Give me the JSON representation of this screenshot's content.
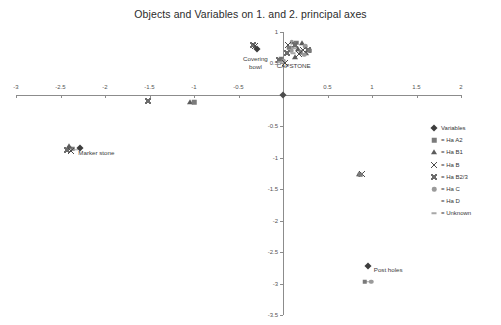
{
  "chart_data": {
    "type": "scatter",
    "title": "Objects and Variables on 1. and 2. principal axes",
    "xlabel": "",
    "ylabel": "",
    "xlim": [
      -3,
      2
    ],
    "ylim": [
      -3.5,
      1
    ],
    "grid": false,
    "legend_position": "right",
    "xticks": [
      -3,
      -2.5,
      -2,
      -1.5,
      -1,
      -0.5,
      0,
      0.5,
      1,
      1.5,
      2
    ],
    "xtick_labels": [
      "-3",
      "-2.5",
      "-2",
      "-1.5",
      "-1",
      "-0.5",
      "",
      "0.5",
      "1",
      "1.5",
      "2"
    ],
    "yticks": [
      1,
      0.5,
      0,
      -0.5,
      -1,
      -1.5,
      -2,
      -2.5,
      -3,
      -3.5
    ],
    "ytick_labels": [
      "1",
      "0.5",
      "",
      "-0.5",
      "-1",
      "-1.5",
      "-2",
      "-2.5",
      "-3",
      "-3.5"
    ],
    "legend": [
      {
        "marker": "diamond",
        "label": "Variables"
      },
      {
        "marker": "square",
        "label": "= Ha A2"
      },
      {
        "marker": "triangle",
        "label": "= Ha B1"
      },
      {
        "marker": "cross",
        "label": "= Ha B"
      },
      {
        "marker": "bowtie",
        "label": "= Ha B2/3"
      },
      {
        "marker": "circle",
        "label": "= Ha C"
      },
      {
        "marker": "plus",
        "label": "= Ha D"
      },
      {
        "marker": "dash",
        "label": "= Unknown"
      }
    ],
    "annotations": [
      {
        "text": "Covering\nbowl",
        "x": -0.31,
        "y": 0.63,
        "align": "center"
      },
      {
        "text": "CAPSTONE",
        "x": 0.12,
        "y": 0.52,
        "align": "center"
      },
      {
        "text": "Marker stone",
        "x": -2.3,
        "y": -0.86,
        "align": "left"
      },
      {
        "text": "Post holes",
        "x": 1.02,
        "y": -2.72,
        "align": "left"
      }
    ],
    "points": [
      {
        "x": -0.34,
        "y": 0.8,
        "marker": "bowtie",
        "group": "Ha B2/3"
      },
      {
        "x": -0.31,
        "y": 0.77,
        "marker": "cross",
        "group": "Ha B"
      },
      {
        "x": -0.32,
        "y": 0.74,
        "marker": "plus",
        "group": "Ha D"
      },
      {
        "x": -0.29,
        "y": 0.73,
        "marker": "diamond",
        "group": "Variables"
      },
      {
        "x": -0.02,
        "y": 0.57,
        "marker": "square",
        "group": "Ha A2"
      },
      {
        "x": -0.05,
        "y": 0.55,
        "marker": "bowtie",
        "group": "Ha B2/3"
      },
      {
        "x": 0.01,
        "y": 0.54,
        "marker": "circle",
        "group": "Ha C"
      },
      {
        "x": -0.03,
        "y": 0.52,
        "marker": "dash",
        "group": "Unknown"
      },
      {
        "x": 0.02,
        "y": 0.51,
        "marker": "cross",
        "group": "Ha B"
      },
      {
        "x": 0.1,
        "y": 0.84,
        "marker": "circle",
        "group": "Ha C"
      },
      {
        "x": 0.15,
        "y": 0.83,
        "marker": "square",
        "group": "Ha A2"
      },
      {
        "x": 0.21,
        "y": 0.82,
        "marker": "triangle",
        "group": "Ha B1"
      },
      {
        "x": 0.06,
        "y": 0.8,
        "marker": "cross",
        "group": "Ha B"
      },
      {
        "x": 0.13,
        "y": 0.79,
        "marker": "bowtie",
        "group": "Ha B2/3"
      },
      {
        "x": 0.19,
        "y": 0.78,
        "marker": "plus",
        "group": "Ha D"
      },
      {
        "x": 0.25,
        "y": 0.77,
        "marker": "circle",
        "group": "Ha C"
      },
      {
        "x": 0.07,
        "y": 0.75,
        "marker": "square",
        "group": "Ha A2"
      },
      {
        "x": 0.12,
        "y": 0.74,
        "marker": "dash",
        "group": "Unknown"
      },
      {
        "x": 0.17,
        "y": 0.73,
        "marker": "triangle",
        "group": "Ha B1"
      },
      {
        "x": 0.23,
        "y": 0.72,
        "marker": "cross",
        "group": "Ha B"
      },
      {
        "x": 0.28,
        "y": 0.71,
        "marker": "bowtie",
        "group": "Ha B2/3"
      },
      {
        "x": 0.09,
        "y": 0.7,
        "marker": "circle",
        "group": "Ha C"
      },
      {
        "x": 0.15,
        "y": 0.69,
        "marker": "plus",
        "group": "Ha D"
      },
      {
        "x": 0.2,
        "y": 0.68,
        "marker": "square",
        "group": "Ha A2"
      },
      {
        "x": 0.26,
        "y": 0.67,
        "marker": "triangle",
        "group": "Ha B1"
      },
      {
        "x": 0.11,
        "y": 0.66,
        "marker": "dash",
        "group": "Unknown"
      },
      {
        "x": 0.18,
        "y": 0.65,
        "marker": "cross",
        "group": "Ha B"
      },
      {
        "x": 0.24,
        "y": 0.64,
        "marker": "circle",
        "group": "Ha C"
      },
      {
        "x": 0.3,
        "y": 0.7,
        "marker": "square",
        "group": "Ha A2"
      },
      {
        "x": 0.05,
        "y": 0.67,
        "marker": "bowtie",
        "group": "Ha B2/3"
      },
      {
        "x": 0.22,
        "y": 0.6,
        "marker": "plus",
        "group": "Ha D"
      },
      {
        "x": 0.14,
        "y": 0.61,
        "marker": "triangle",
        "group": "Ha B1"
      },
      {
        "x": -1.52,
        "y": -0.09,
        "marker": "bowtie",
        "group": "Ha B2/3"
      },
      {
        "x": -1.05,
        "y": -0.11,
        "marker": "triangle",
        "group": "Ha B1"
      },
      {
        "x": -1.0,
        "y": -0.12,
        "marker": "square",
        "group": "Ha A2"
      },
      {
        "x": -2.4,
        "y": -0.84,
        "marker": "circle",
        "group": "Ha C"
      },
      {
        "x": -2.36,
        "y": -0.86,
        "marker": "square",
        "group": "Ha A2"
      },
      {
        "x": -2.43,
        "y": -0.88,
        "marker": "bowtie",
        "group": "Ha B2/3"
      },
      {
        "x": -2.38,
        "y": -0.9,
        "marker": "cross",
        "group": "Ha B"
      },
      {
        "x": -2.33,
        "y": -0.87,
        "marker": "dash",
        "group": "Unknown"
      },
      {
        "x": -2.41,
        "y": -0.81,
        "marker": "triangle",
        "group": "Ha B1"
      },
      {
        "x": -2.35,
        "y": -0.83,
        "marker": "plus",
        "group": "Ha D"
      },
      {
        "x": -2.28,
        "y": -0.85,
        "marker": "diamond",
        "group": "Variables"
      },
      {
        "x": 0.85,
        "y": -1.25,
        "marker": "triangle",
        "group": "Ha B1"
      },
      {
        "x": 0.89,
        "y": -1.25,
        "marker": "cross",
        "group": "Ha B"
      },
      {
        "x": 0.87,
        "y": -1.27,
        "marker": "square",
        "group": "Ha A2"
      },
      {
        "x": 0.96,
        "y": -2.72,
        "marker": "diamond",
        "group": "Variables"
      },
      {
        "x": 0.95,
        "y": -2.97,
        "marker": "dash",
        "group": "Unknown"
      },
      {
        "x": 0.99,
        "y": -2.97,
        "marker": "circle",
        "group": "Ha C"
      },
      {
        "x": 0.92,
        "y": -2.97,
        "marker": "square",
        "group": "Ha A2"
      }
    ]
  }
}
